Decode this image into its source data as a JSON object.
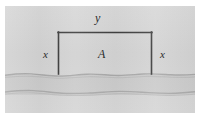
{
  "figure": {
    "caption": "",
    "labels": {
      "top_side": "y",
      "left_side": "x",
      "right_side": "x",
      "enclosed_region": "A"
    },
    "colors": {
      "panel_background": "#d2d2d2",
      "land": "#d5d5d5",
      "water": "#cbcbcb",
      "far_bank": "#d4d4d4",
      "fence_stroke": "#3a3a3a",
      "shore_stroke": "#a8a8a8",
      "label_text": "#2b2b2b",
      "page_background": "#ffffff"
    },
    "geometry": {
      "fence_left_x": 53,
      "fence_right_x": 147,
      "fence_top_y": 26,
      "fence_bottom_y": 68,
      "panel_width": 190,
      "panel_height": 107
    }
  }
}
